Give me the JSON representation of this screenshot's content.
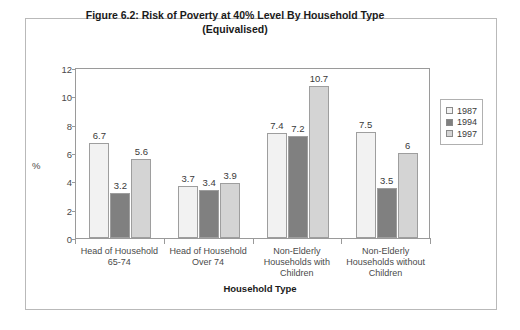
{
  "chart_data": {
    "type": "bar",
    "title": "Figure 6.2: Risk of Poverty at 40% Level By Household Type (Equivalised)",
    "title_line1": "Figure 6.2: Risk of Poverty at 40% Level By Household Type",
    "title_line2": "(Equivalised)",
    "xlabel": "Household Type",
    "ylabel": "%",
    "ylim": [
      0,
      12
    ],
    "yticks": [
      0,
      2,
      4,
      6,
      8,
      10,
      12
    ],
    "grid": false,
    "legend_position": "right",
    "categories": [
      "Head of Household 65-74",
      "Head of Household Over 74",
      "Non-Elderly Households with Children",
      "Non-Elderly Households without Children"
    ],
    "category_lines": [
      [
        "Head of Household",
        "65-74"
      ],
      [
        "Head of Household",
        "Over 74"
      ],
      [
        "Non-Elderly",
        "Households with",
        "Children"
      ],
      [
        "Non-Elderly",
        "Households without",
        "Children"
      ]
    ],
    "series": [
      {
        "name": "1987",
        "color": "#f2f2f2",
        "values": [
          6.7,
          3.7,
          7.4,
          7.5
        ],
        "labels": [
          "6.7",
          "3.7",
          "7.4",
          "7.5"
        ]
      },
      {
        "name": "1994",
        "color": "#808080",
        "values": [
          3.2,
          3.4,
          7.2,
          3.5
        ],
        "labels": [
          "3.2",
          "3.4",
          "7.2",
          "3.5"
        ]
      },
      {
        "name": "1997",
        "color": "#d4d4d4",
        "values": [
          5.6,
          3.9,
          10.7,
          6.0
        ],
        "labels": [
          "5.6",
          "3.9",
          "10.7",
          "6"
        ]
      }
    ]
  }
}
